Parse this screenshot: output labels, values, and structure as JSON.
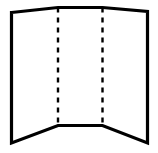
{
  "figure": {
    "name": "folded-panel-diagram",
    "title": "",
    "caption": "",
    "background_color": "#ffffff",
    "width": 158,
    "height": 153
  },
  "style": {
    "outline_color": "#000000",
    "outline_width": 3.2,
    "fold_color": "#000000",
    "fold_width": 2.4,
    "fold_dash": "5 5",
    "panel_fill": "#ffffff"
  },
  "geometry": {
    "top_left": {
      "x": 11.5,
      "y": 12.5
    },
    "top_apex_left": {
      "x": 58,
      "y": 7.5
    },
    "top_apex_right": {
      "x": 102.5,
      "y": 7.5
    },
    "top_right": {
      "x": 147.5,
      "y": 11.5
    },
    "bottom_left": {
      "x": 11.5,
      "y": 143
    },
    "bottom_inner_left": {
      "x": 58,
      "y": 125.5
    },
    "bottom_inner_right": {
      "x": 102.5,
      "y": 125.5
    },
    "bottom_right": {
      "x": 147.5,
      "y": 143
    }
  },
  "outline_path": "M 11.5 12.5 L 58 7.5 L 102.5 7.5 L 147.5 11.5 L 147.5 143 L 102.5 125.5 L 58 125.5 L 11.5 143 Z",
  "fold_lines": [
    {
      "name": "fold-line-left",
      "x": 58,
      "y_top": 7.5,
      "y_bottom": 125.5,
      "style": "dashed"
    },
    {
      "name": "fold-line-right",
      "x": 102.5,
      "y_top": 7.5,
      "y_bottom": 125.5,
      "style": "dashed"
    }
  ],
  "panels": [
    {
      "name": "panel-left",
      "label": ""
    },
    {
      "name": "panel-center",
      "label": ""
    },
    {
      "name": "panel-right",
      "label": ""
    }
  ],
  "labels": []
}
